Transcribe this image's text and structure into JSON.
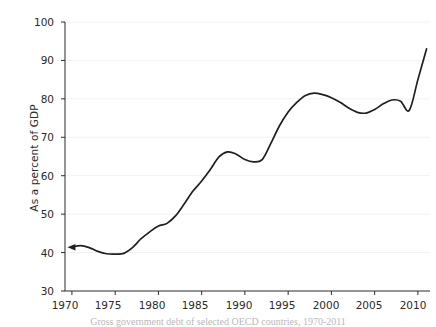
{
  "chart_data": {
    "type": "line",
    "title": "",
    "caption": "Gross government debt of selected OECD countries, 1970-2011",
    "xlabel": "",
    "ylabel": "As a percent of GDP",
    "xlim": [
      1969.2,
      2011.4
    ],
    "ylim": [
      30,
      100
    ],
    "grid": true,
    "grid_axis": "y",
    "legend": "none",
    "line_color": "#1f1f1f",
    "line_width": 1.7,
    "start_marker": "arrow",
    "xticks": [
      1970,
      1975,
      1980,
      1985,
      1990,
      1995,
      2000,
      2005,
      2010
    ],
    "xtick_labels": [
      "1970",
      "1975",
      "1980",
      "1985",
      "1990",
      "1995",
      "2000",
      "2005",
      "2010"
    ],
    "yticks": [
      30,
      40,
      50,
      60,
      70,
      80,
      90,
      100
    ],
    "ytick_labels": [
      "30",
      "40",
      "50",
      "60",
      "70",
      "80",
      "90",
      "100"
    ],
    "series": [
      {
        "name": "Gross government debt",
        "x": [
          1970,
          1971,
          1972,
          1973,
          1974,
          1975,
          1976,
          1977,
          1978,
          1979,
          1980,
          1981,
          1982,
          1983,
          1984,
          1985,
          1986,
          1987,
          1988,
          1989,
          1990,
          1991,
          1992,
          1993,
          1994,
          1995,
          1996,
          1997,
          1998,
          1999,
          2000,
          2001,
          2002,
          2003,
          2004,
          2005,
          2006,
          2007,
          2008,
          2009,
          2010,
          2011
        ],
        "values": [
          41.4,
          41.8,
          41.3,
          40.3,
          39.7,
          39.6,
          39.8,
          41.3,
          43.6,
          45.4,
          46.9,
          47.6,
          49.6,
          52.7,
          56.0,
          58.6,
          61.6,
          64.9,
          66.2,
          65.6,
          64.2,
          63.6,
          64.2,
          68.4,
          73.0,
          76.6,
          79.1,
          80.9,
          81.5,
          81.1,
          80.3,
          79.1,
          77.6,
          76.5,
          76.3,
          77.2,
          78.7,
          79.7,
          79.4,
          77.0,
          85.0,
          93.0
        ]
      }
    ]
  },
  "axes": {
    "y_axis_name": "y-axis",
    "x_axis_name": "x-axis"
  }
}
